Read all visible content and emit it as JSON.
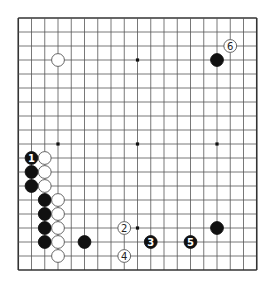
{
  "board": {
    "size": 19,
    "origin_x": 18.25,
    "origin_y": 18,
    "spacing_x": 13.25,
    "spacing_y": 14,
    "stone_radius": 6.4,
    "line_color": "#555555",
    "border_color": "#333333",
    "star_points": [
      [
        3,
        3
      ],
      [
        9,
        3
      ],
      [
        15,
        3
      ],
      [
        3,
        9
      ],
      [
        9,
        9
      ],
      [
        15,
        9
      ],
      [
        3,
        15
      ],
      [
        9,
        15
      ],
      [
        15,
        15
      ]
    ]
  },
  "stones": [
    {
      "color": "white",
      "col": 3,
      "row": 3,
      "label": ""
    },
    {
      "color": "black",
      "col": 15,
      "row": 3,
      "label": ""
    },
    {
      "color": "white",
      "col": 16,
      "row": 2,
      "label": "6"
    },
    {
      "color": "black",
      "col": 1,
      "row": 10,
      "label": "1"
    },
    {
      "color": "black",
      "col": 1,
      "row": 11,
      "label": ""
    },
    {
      "color": "black",
      "col": 1,
      "row": 12,
      "label": ""
    },
    {
      "color": "white",
      "col": 2,
      "row": 10,
      "label": ""
    },
    {
      "color": "white",
      "col": 2,
      "row": 11,
      "label": ""
    },
    {
      "color": "white",
      "col": 2,
      "row": 12,
      "label": ""
    },
    {
      "color": "black",
      "col": 2,
      "row": 13,
      "label": ""
    },
    {
      "color": "black",
      "col": 2,
      "row": 14,
      "label": ""
    },
    {
      "color": "black",
      "col": 2,
      "row": 15,
      "label": ""
    },
    {
      "color": "black",
      "col": 2,
      "row": 16,
      "label": ""
    },
    {
      "color": "white",
      "col": 3,
      "row": 13,
      "label": ""
    },
    {
      "color": "white",
      "col": 3,
      "row": 14,
      "label": ""
    },
    {
      "color": "white",
      "col": 3,
      "row": 15,
      "label": ""
    },
    {
      "color": "white",
      "col": 3,
      "row": 16,
      "label": ""
    },
    {
      "color": "white",
      "col": 3,
      "row": 17,
      "label": ""
    },
    {
      "color": "black",
      "col": 5,
      "row": 16,
      "label": ""
    },
    {
      "color": "white",
      "col": 8,
      "row": 15,
      "label": "2"
    },
    {
      "color": "black",
      "col": 10,
      "row": 16,
      "label": "3"
    },
    {
      "color": "white",
      "col": 8,
      "row": 17,
      "label": "4"
    },
    {
      "color": "black",
      "col": 13,
      "row": 16,
      "label": "5"
    },
    {
      "color": "black",
      "col": 15,
      "row": 15,
      "label": ""
    }
  ]
}
